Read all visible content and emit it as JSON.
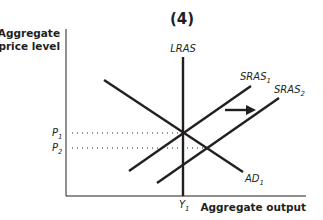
{
  "diagram": {
    "panel_label": "(4)",
    "y_axis_label_line1": "Aggregate",
    "y_axis_label_line2": "price level",
    "x_axis_label": "Aggregate output",
    "curves": {
      "lras": {
        "label": "LRAS",
        "sub": ""
      },
      "sras1": {
        "label": "SRAS",
        "sub": "1"
      },
      "sras2": {
        "label": "SRAS",
        "sub": "2"
      },
      "ad1": {
        "label": "AD",
        "sub": "1"
      }
    },
    "price_levels": {
      "p1": {
        "label": "P",
        "sub": "1"
      },
      "p2": {
        "label": "P",
        "sub": "2"
      }
    },
    "output_levels": {
      "y1": {
        "label": "Y",
        "sub": "1"
      }
    },
    "shift_arrow": "SRAS shifts right (SRAS1 to SRAS2)",
    "colors": {
      "ink": "#231f20",
      "background": "#ffffff"
    }
  }
}
